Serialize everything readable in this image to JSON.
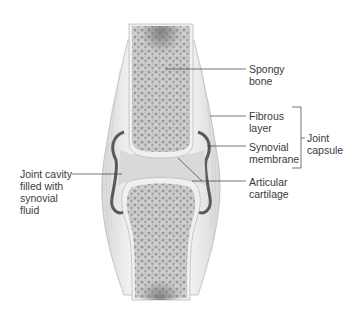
{
  "diagram": {
    "type": "anatomical-illustration",
    "labels": {
      "spongy_bone": "Spongy\nbone",
      "fibrous_layer": "Fibrous\nlayer",
      "synovial_membrane": "Synovial\nmembrane",
      "joint_capsule": "Joint\ncapsule",
      "articular_cartilage": "Articular\ncartilage",
      "joint_cavity": "Joint cavity\nfilled with\nsynovial\nfluid"
    },
    "colors": {
      "bone_fill": "#c9c9c9",
      "bone_pore": "#8e8e8e",
      "cartilage": "#eeeeee",
      "synovial_membrane": "#5a5a5a",
      "joint_cavity": "#d9d9d9",
      "capsule": "#e6e6e6",
      "leader_line": "#3a3a3a",
      "label_text": "#3a3a3a"
    }
  }
}
